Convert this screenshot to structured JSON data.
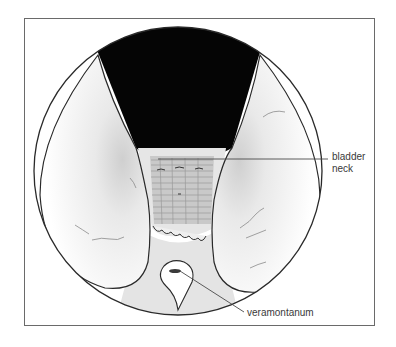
{
  "figure": {
    "labels": {
      "bladder_neck_line1": "bladder",
      "bladder_neck_line2": "neck",
      "veramontanum": "veramontanum"
    }
  },
  "colors": {
    "outline": "#2a2a2a",
    "lumen": "#050505",
    "frame": "#6a6a6a",
    "shading": "#d8d8d8",
    "label_text": "#3a3a3a"
  }
}
